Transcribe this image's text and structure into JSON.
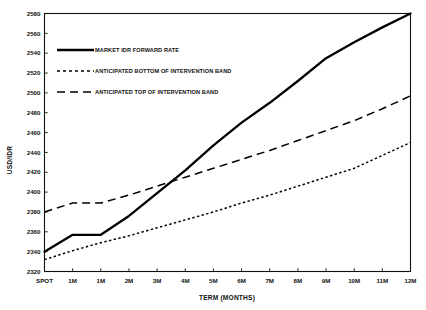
{
  "chart_data": {
    "type": "line",
    "title": "",
    "xlabel": "TERM (MONTHS)",
    "ylabel": "USD/IDR",
    "categories": [
      "SPOT",
      "1M",
      "1M",
      "2M",
      "3M",
      "4M",
      "5M",
      "6M",
      "7M",
      "8M",
      "9M",
      "10M",
      "11M",
      "12M"
    ],
    "ylim": [
      2320,
      2580
    ],
    "xlim": [
      0,
      13
    ],
    "ytick_labels": [
      "2320",
      "2340",
      "2360",
      "2380",
      "2400",
      "2420",
      "2440",
      "2460",
      "2480",
      "2500",
      "2520",
      "2540",
      "2560",
      "2580"
    ],
    "yticks": [
      2320,
      2340,
      2360,
      2380,
      2400,
      2420,
      2440,
      2460,
      2480,
      2500,
      2520,
      2540,
      2560,
      2580
    ],
    "grid": false,
    "legend_position": "upper-left",
    "series": [
      {
        "name": "MARKET IDR FORWARD RATE",
        "style": "solid",
        "values": [
          2340,
          2357,
          2357,
          2376,
          2399,
          2422,
          2447,
          2470,
          2490,
          2512,
          2535,
          2551,
          2566,
          2580
        ]
      },
      {
        "name": "ANTICIPATED BOTTOM OF INTERVENTION BAND",
        "style": "dotted",
        "values": [
          2332,
          2341,
          2349,
          2356,
          2364,
          2372,
          2380,
          2389,
          2397,
          2406,
          2415,
          2424,
          2437,
          2450
        ]
      },
      {
        "name": "ANTICIPATED TOP OF INTERVENTION BAND",
        "style": "dashed",
        "values": [
          2380,
          2389,
          2389,
          2397,
          2406,
          2415,
          2424,
          2433,
          2442,
          2452,
          2462,
          2472,
          2484,
          2497
        ]
      }
    ]
  },
  "axes": {
    "y_axis_label": "USD/IDR",
    "x_axis_label": "TERM (MONTHS)"
  },
  "legend": {
    "entries": [
      {
        "label": "MARKET IDR FORWARD RATE",
        "swatch": "solid-line-swatch"
      },
      {
        "label": "ANTICIPATED BOTTOM OF INTERVENTION BAND",
        "swatch": "dotted-line-swatch"
      },
      {
        "label": "ANTICIPATED TOP OF INTERVENTION BAND",
        "swatch": "dashed-line-swatch"
      }
    ]
  }
}
